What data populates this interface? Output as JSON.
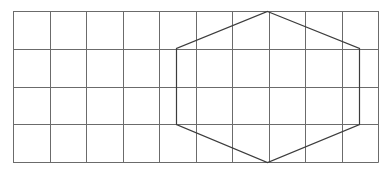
{
  "diagram": {
    "type": "hexagon-on-grid",
    "grid": {
      "columns": 10,
      "rows": 4,
      "left": 13,
      "top": 11,
      "right": 378,
      "bottom": 162,
      "line_color": "#6b6b6b",
      "line_width": 1
    },
    "hexagon": {
      "vertices_grid_units": [
        [
          6.9,
          0
        ],
        [
          9.4,
          1
        ],
        [
          9.4,
          3
        ],
        [
          6.9,
          4
        ],
        [
          4.4,
          3
        ],
        [
          4.4,
          1
        ]
      ],
      "vertices_px": [
        [
          267,
          11
        ],
        [
          359,
          48
        ],
        [
          359,
          124
        ],
        [
          267,
          162
        ],
        [
          176,
          124
        ],
        [
          176,
          48
        ]
      ],
      "stroke_color": "#3c3c3c",
      "stroke_width": 1.2
    },
    "background": "#ffffff"
  }
}
